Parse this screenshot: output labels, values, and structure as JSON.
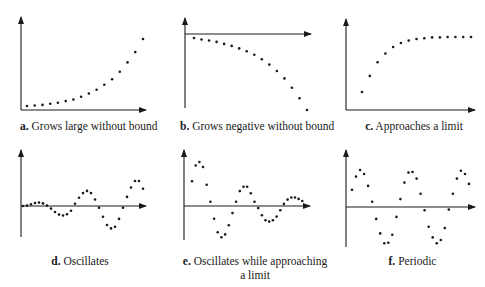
{
  "figure": {
    "panels": [
      {
        "id": "a",
        "letter": "a.",
        "caption": "Grows large without bound"
      },
      {
        "id": "b",
        "letter": "b.",
        "caption": "Grows negative without bound"
      },
      {
        "id": "c",
        "letter": "c.",
        "caption": "Approaches a limit"
      },
      {
        "id": "d",
        "letter": "d.",
        "caption": "Oscillates"
      },
      {
        "id": "e",
        "letter": "e.",
        "caption": "Oscillates while approaching",
        "caption_line2": "a limit"
      },
      {
        "id": "f",
        "letter": "f.",
        "caption": "Periodic"
      }
    ]
  },
  "chart_data": [
    {
      "type": "scatter",
      "title": "a. Grows large without bound",
      "xlabel": "",
      "ylabel": "",
      "axes": {
        "origin": "bottom-left",
        "x_arrow": true,
        "y_arrow": true,
        "ticks": false
      },
      "grid": false,
      "x": [
        1,
        2,
        3,
        4,
        5,
        6,
        7,
        8,
        9,
        10,
        11,
        12,
        13,
        14,
        15,
        16
      ],
      "y": [
        0.5,
        0.6,
        0.7,
        0.9,
        1.1,
        1.4,
        1.7,
        2.2,
        2.8,
        3.5,
        4.4,
        5.4,
        6.8,
        8.5,
        10.4,
        12.8
      ]
    },
    {
      "type": "scatter",
      "title": "b. Grows negative without bound",
      "xlabel": "",
      "ylabel": "",
      "axes": {
        "origin": "top-left",
        "x_arrow": true,
        "y_arrow": true,
        "ticks": false
      },
      "grid": false,
      "x": [
        1,
        2,
        3,
        4,
        5,
        6,
        7,
        8,
        9,
        10,
        11,
        12,
        13,
        14,
        15,
        16
      ],
      "y": [
        -0.4,
        -0.7,
        -0.9,
        -1.2,
        -1.6,
        -2.0,
        -2.5,
        -3.1,
        -3.8,
        -4.7,
        -5.8,
        -7.1,
        -8.6,
        -10.5,
        -12.6,
        -15.0
      ]
    },
    {
      "type": "scatter",
      "title": "c. Approaches a limit",
      "xlabel": "",
      "ylabel": "",
      "axes": {
        "origin": "bottom-left",
        "x_arrow": true,
        "y_arrow": true,
        "ticks": false
      },
      "grid": false,
      "x": [
        1,
        2,
        3,
        4,
        5,
        6,
        7,
        8,
        9,
        10,
        11,
        12,
        13,
        14,
        15
      ],
      "y": [
        2.0,
        4.0,
        5.7,
        6.8,
        7.6,
        8.1,
        8.4,
        8.6,
        8.7,
        8.8,
        8.8,
        8.85,
        8.85,
        8.85,
        8.85
      ]
    },
    {
      "type": "scatter",
      "title": "d. Oscillates",
      "xlabel": "",
      "ylabel": "",
      "axes": {
        "origin": "mid-left",
        "x_arrow": true,
        "y_arrow": true,
        "ticks": false
      },
      "grid": false,
      "x": [
        1,
        2,
        3,
        4,
        5,
        6,
        7,
        8,
        9,
        10,
        11,
        12,
        13,
        14,
        15,
        16,
        17,
        18,
        19,
        20,
        21,
        22,
        23,
        24,
        25,
        26,
        27,
        28,
        29,
        30,
        31,
        32,
        33
      ],
      "y": [
        0.0,
        0.1,
        0.4,
        0.7,
        0.8,
        0.6,
        0.1,
        -0.6,
        -1.4,
        -2.0,
        -2.2,
        -1.9,
        -1.1,
        0.5,
        1.9,
        3.0,
        3.5,
        3.0,
        1.5,
        -0.4,
        -2.5,
        -4.4,
        -5.2,
        -4.8,
        -3.0,
        -0.4,
        2.1,
        4.3,
        5.8,
        5.8,
        4.0
      ]
    },
    {
      "type": "scatter",
      "title": "e. Oscillates while approaching a limit",
      "xlabel": "",
      "ylabel": "",
      "axes": {
        "origin": "mid-left",
        "x_arrow": true,
        "y_arrow": true,
        "ticks": false
      },
      "grid": false,
      "x": [
        1,
        2,
        3,
        4,
        5,
        6,
        7,
        8,
        9,
        10,
        11,
        12,
        13,
        14,
        15,
        16,
        17,
        18,
        19,
        20,
        21,
        22,
        23,
        24,
        25,
        26,
        27,
        28,
        29,
        30,
        31,
        32
      ],
      "y": [
        3.5,
        5.7,
        6.2,
        5.5,
        3.0,
        0.6,
        -1.8,
        -3.7,
        -4.4,
        -4.0,
        -2.7,
        -1.0,
        0.6,
        2.1,
        2.7,
        2.7,
        1.8,
        0.6,
        -0.3,
        -1.3,
        -2.0,
        -2.2,
        -2.0,
        -1.5,
        -0.6,
        0.3,
        0.9,
        1.2,
        1.2,
        1.0,
        0.7,
        0.0
      ]
    },
    {
      "type": "scatter",
      "title": "f. Periodic",
      "xlabel": "",
      "ylabel": "",
      "axes": {
        "origin": "mid-left",
        "x_arrow": true,
        "y_arrow": true,
        "ticks": false
      },
      "grid": false,
      "x": [
        1,
        2,
        3,
        4,
        5,
        6,
        7,
        8,
        9,
        10,
        11,
        12,
        13,
        14,
        15,
        16,
        17,
        18,
        19,
        20,
        21,
        22,
        23,
        24,
        25,
        26,
        27,
        28,
        29,
        30,
        31,
        32
      ],
      "y": [
        2.6,
        4.6,
        5.6,
        5.0,
        3.2,
        0.8,
        -1.8,
        -4.0,
        -5.5,
        -5.4,
        -4.2,
        -1.5,
        1.2,
        3.7,
        5.2,
        5.3,
        4.3,
        2.0,
        -0.5,
        -3.0,
        -4.6,
        -5.5,
        -5.0,
        -3.2,
        -0.4,
        2.0,
        4.3,
        5.5,
        5.0,
        3.5
      ]
    }
  ]
}
